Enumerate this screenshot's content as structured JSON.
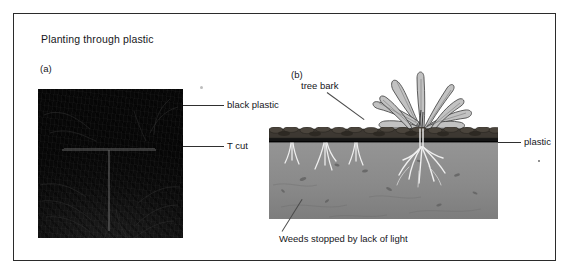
{
  "figure": {
    "title": "Planting through plastic",
    "panels": [
      {
        "letter": "(a)",
        "name": "photograph-black-plastic-with-t-cut",
        "description": "Photograph of a black plastic sheet laid on the ground with a T-shaped cut in the centre",
        "labels": [
          {
            "text": "black plastic",
            "points_to": "plastic sheet surface"
          },
          {
            "text": "T cut",
            "points_to": "T-shaped slit in the plastic"
          }
        ]
      },
      {
        "letter": "(b)",
        "name": "cross-section-planting-through-plastic",
        "description": "Cross-section drawing showing bark mulch over plastic sheet over soil, with a planted leafy plant rooting through the plastic and weeds stopped beneath it",
        "labels": [
          {
            "text": "tree bark",
            "points_to": "bark mulch layer on top of the plastic"
          },
          {
            "text": "plastic",
            "points_to": "black plastic sheet layer"
          },
          {
            "text": "Weeds stopped by lack of light",
            "points_to": "pale weed shoots trapped under the plastic"
          }
        ]
      }
    ]
  },
  "colors": {
    "frame_border": "#2b2b2b",
    "text": "#16161a",
    "photo_black_plastic": "#0d0d0d",
    "bark_mulch": "#3b3630",
    "plastic_sheet": "#171717",
    "soil": "#8d8d8d",
    "plant_foliage": "#b9b9b9",
    "page_background": "#ffffff"
  }
}
